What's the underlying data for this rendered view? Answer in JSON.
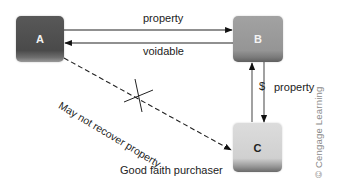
{
  "nodes": {
    "a": {
      "label": "A",
      "color": "#4e4e4e"
    },
    "b": {
      "label": "B",
      "color": "#9a9a9a"
    },
    "c": {
      "label": "C",
      "color": "#d4d4d4"
    }
  },
  "edges": {
    "a_to_b": {
      "label": "property",
      "style": "solid"
    },
    "b_to_a": {
      "label": "voidable",
      "style": "solid"
    },
    "c_to_b": {
      "label": "$",
      "style": "solid"
    },
    "b_to_c": {
      "label": "property",
      "style": "solid"
    },
    "a_to_c": {
      "label": "May not recover property",
      "style": "dashed",
      "crossed_out": true
    }
  },
  "annotations": {
    "node_c_caption": "Good faith purchaser",
    "copyright": "© Cengage Learning"
  }
}
